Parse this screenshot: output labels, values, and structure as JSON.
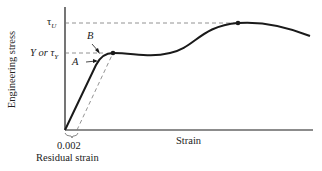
{
  "diagram": {
    "y_axis_label": "Engineering stress",
    "x_axis_label": "Strain",
    "labels": {
      "tau_u": "τ",
      "tau_u_sub": "U",
      "yield": "Y or τ",
      "yield_sub": "Y",
      "point_a": "A",
      "point_b": "B",
      "offset_value": "0.002",
      "residual": "Residual strain"
    },
    "colors": {
      "curve": "#1a1a1a",
      "axis": "#1a1a1a",
      "dashed": "#777777"
    }
  }
}
